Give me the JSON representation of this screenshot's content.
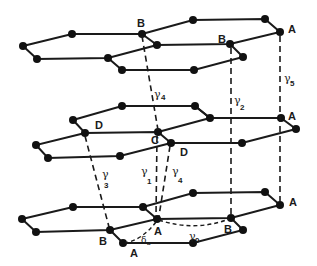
{
  "figure": {
    "atom_labels": {
      "top_B1": "B",
      "top_B2": "B",
      "top_A": "A",
      "mid_D": "D",
      "mid_C": "C",
      "mid_D2": "D",
      "mid_A": "A",
      "bot_A_right": "A",
      "bot_A_center": "A",
      "bot_B_left": "B",
      "bot_B_right": "B",
      "bot_A_bottom": "A"
    },
    "coupling_labels": {
      "gamma0": {
        "symbol": "γ",
        "sub": "0"
      },
      "gamma1": {
        "symbol": "γ",
        "sub": "1"
      },
      "gamma2": {
        "symbol": "γ",
        "sub": "2"
      },
      "gamma3": {
        "symbol": "γ",
        "sub": "3"
      },
      "gamma4_top": {
        "symbol": "γ",
        "sub": "4"
      },
      "gamma4_mid": {
        "symbol": "γ",
        "sub": "4"
      },
      "gamma5": {
        "symbol": "γ",
        "sub": "5"
      },
      "delta": {
        "symbol": "δ",
        "sub": "a"
      }
    },
    "colors": {
      "ink": "#1a1a1a",
      "background": "#ffffff"
    }
  }
}
